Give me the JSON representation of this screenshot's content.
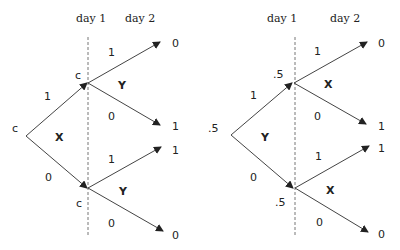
{
  "trees": [
    {
      "day_labels": [
        "day 1",
        "day 2"
      ],
      "root_label": "c",
      "root_var": "X",
      "root_edges": [
        "1",
        "0"
      ],
      "upper_node_label": "c",
      "upper_var": "Y",
      "upper_edges": [
        "1",
        "0"
      ],
      "upper_leaves": [
        "0",
        "1"
      ],
      "lower_node_label": "c",
      "lower_var": "Y",
      "lower_edges": [
        "1",
        "0"
      ],
      "lower_leaves": [
        "1",
        "0"
      ]
    },
    {
      "day_labels": [
        "day 1",
        "day 2"
      ],
      "root_label": ".5",
      "root_var": "Y",
      "root_edges": [
        "1",
        "0"
      ],
      "upper_node_label": ".5",
      "upper_var": "X",
      "upper_edges": [
        "1",
        "0"
      ],
      "upper_leaves": [
        "0",
        "1"
      ],
      "lower_node_label": ".5",
      "lower_var": "X",
      "lower_edges": [
        "1",
        "0"
      ],
      "lower_leaves": [
        "1",
        "0"
      ]
    }
  ]
}
